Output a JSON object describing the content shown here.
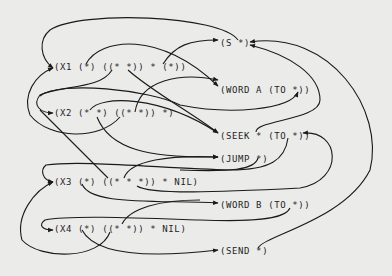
{
  "diagram": {
    "background": "#ebebea",
    "ink": "#1a1a1a",
    "patterns": [
      {
        "id": "x1",
        "label": "(X1 (*) ((* *)) * (*))"
      },
      {
        "id": "x2",
        "label": "(X2 (* *) ((* *)) *)"
      },
      {
        "id": "x3",
        "label": "(X3 (*) ((* * *)) * NIL)"
      },
      {
        "id": "x4",
        "label": "(X4 (*) ((* *)) * NIL)"
      }
    ],
    "actions": [
      {
        "id": "s",
        "label": "(S *)"
      },
      {
        "id": "word_a",
        "label": "(WORD A (TO *))"
      },
      {
        "id": "seek",
        "label": "(SEEK * (TO *))"
      },
      {
        "id": "jump",
        "label": "(JUMP *)"
      },
      {
        "id": "word_b",
        "label": "(WORD B (TO *))"
      },
      {
        "id": "send",
        "label": "(SEND *)"
      }
    ],
    "edges": [
      {
        "from": "s",
        "to": "x1"
      },
      {
        "from": "x1",
        "to": "word_a"
      },
      {
        "from": "x1",
        "to": "s"
      },
      {
        "from": "x1",
        "to": "seek"
      },
      {
        "from": "x1",
        "to": "x2"
      },
      {
        "from": "x2",
        "to": "word_a"
      },
      {
        "from": "x2",
        "to": "seek"
      },
      {
        "from": "x2",
        "to": "jump"
      },
      {
        "from": "x2",
        "to": "x1"
      },
      {
        "from": "seek",
        "to": "s"
      },
      {
        "from": "send",
        "to": "s"
      },
      {
        "from": "x3",
        "to": "seek"
      },
      {
        "from": "x3",
        "to": "word_b"
      },
      {
        "from": "x3",
        "to": "jump"
      },
      {
        "from": "jump",
        "to": "x3"
      },
      {
        "from": "x4",
        "to": "x3"
      },
      {
        "from": "x4",
        "to": "send"
      },
      {
        "from": "word_b",
        "to": "x4"
      }
    ]
  }
}
